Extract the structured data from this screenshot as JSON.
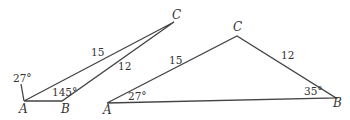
{
  "diagram": {
    "triangle1": {
      "vertices": {
        "A": "A",
        "B": "B",
        "C": "C"
      },
      "side_AC": "15",
      "side_BC": "12",
      "angle_A": "27°",
      "angle_B": "145°"
    },
    "triangle2": {
      "vertices": {
        "A": "A",
        "B": "B",
        "C": "C"
      },
      "side_AC": "15",
      "side_BC": "12",
      "angle_A": "27°",
      "angle_B": "35°"
    }
  }
}
